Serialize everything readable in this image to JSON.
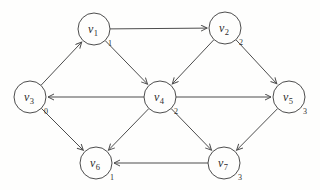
{
  "figure": {
    "type": "directed-graph",
    "background": "#fefefd",
    "stroke_color": "#4d4d4d",
    "text_color": "#2e2e2e",
    "node_radius": 16,
    "nodes": [
      {
        "id": "v1",
        "base": "v",
        "sub": "1",
        "value": "1",
        "x": 94,
        "y": 29
      },
      {
        "id": "v2",
        "base": "v",
        "sub": "2",
        "value": "2",
        "x": 225,
        "y": 28
      },
      {
        "id": "v3",
        "base": "v",
        "sub": "3",
        "value": "0",
        "x": 30,
        "y": 97
      },
      {
        "id": "v4",
        "base": "v",
        "sub": "4",
        "value": "2",
        "x": 160,
        "y": 97
      },
      {
        "id": "v5",
        "base": "v",
        "sub": "5",
        "value": "3",
        "x": 289,
        "y": 97
      },
      {
        "id": "v6",
        "base": "v",
        "sub": "6",
        "value": "1",
        "x": 96,
        "y": 163
      },
      {
        "id": "v7",
        "base": "v",
        "sub": "7",
        "value": "3",
        "x": 224,
        "y": 163
      }
    ],
    "edges": [
      {
        "from": "v3",
        "to": "v1"
      },
      {
        "from": "v1",
        "to": "v2"
      },
      {
        "from": "v1",
        "to": "v4"
      },
      {
        "from": "v2",
        "to": "v4"
      },
      {
        "from": "v2",
        "to": "v5"
      },
      {
        "from": "v4",
        "to": "v3"
      },
      {
        "from": "v4",
        "to": "v5"
      },
      {
        "from": "v3",
        "to": "v6"
      },
      {
        "from": "v4",
        "to": "v6"
      },
      {
        "from": "v4",
        "to": "v7"
      },
      {
        "from": "v5",
        "to": "v7"
      },
      {
        "from": "v7",
        "to": "v6"
      }
    ]
  }
}
